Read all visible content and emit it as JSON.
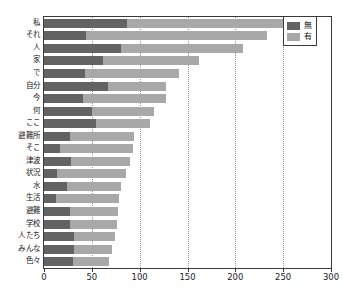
{
  "chart_data": {
    "type": "bar",
    "orientation": "horizontal",
    "stacked": true,
    "title": "",
    "xlabel": "",
    "ylabel": "",
    "xlim": [
      0,
      300
    ],
    "xticks": [
      0,
      50,
      100,
      150,
      200,
      250,
      300
    ],
    "xtick_labels": [
      "0",
      "50",
      "100",
      "150",
      "200",
      "250",
      "300"
    ],
    "grid": true,
    "grid_axis": "x",
    "legend_position": "top-right",
    "categories": [
      "私",
      "それ",
      "人",
      "家",
      "で",
      "自分",
      "今",
      "何",
      "ここ",
      "避難所",
      "そこ",
      "津波",
      "状況",
      "水",
      "生活",
      "避難",
      "学校",
      "人たち",
      "みんな",
      "色々"
    ],
    "series": [
      {
        "name": "無",
        "color": "#636363",
        "values": [
          87,
          44,
          81,
          62,
          43,
          67,
          41,
          50,
          54,
          27,
          17,
          28,
          14,
          24,
          13,
          27,
          27,
          31,
          31,
          30
        ]
      },
      {
        "name": "有",
        "color": "#a8a8a8",
        "values": [
          168,
          189,
          127,
          100,
          98,
          61,
          87,
          65,
          57,
          67,
          76,
          62,
          72,
          57,
          65,
          50,
          49,
          43,
          40,
          38
        ]
      }
    ],
    "totals": [
      255,
      233,
      208,
      162,
      141,
      128,
      128,
      115,
      111,
      94,
      93,
      90,
      86,
      81,
      78,
      77,
      76,
      74,
      71,
      68
    ]
  },
  "legend": {
    "items": [
      {
        "label": "無",
        "color": "#636363"
      },
      {
        "label": "有",
        "color": "#a8a8a8"
      }
    ]
  }
}
